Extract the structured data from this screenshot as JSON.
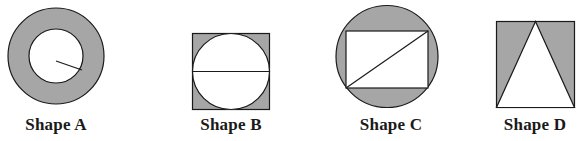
{
  "colors": {
    "shade": "#a6a6a6",
    "stroke": "#1a1a1a",
    "background": "#ffffff",
    "unshaded": "#ffffff"
  },
  "shapes": [
    {
      "id": "A",
      "label": "Shape A",
      "description": "Annulus: shaded ring between an outer circle and a concentric inner circle; a radius segment drawn inside the inner circle"
    },
    {
      "id": "B",
      "label": "Shape B",
      "description": "Square with an inscribed circle; the circle is unshaded with a horizontal diameter; the four corner regions are shaded"
    },
    {
      "id": "C",
      "label": "Shape C",
      "description": "Circle with an inscribed rectangle; the rectangle is unshaded with a diagonal from bottom-left to top-right; the four circular segments outside the rectangle are shaded"
    },
    {
      "id": "D",
      "label": "Shape D",
      "description": "Rectangle with an inscribed isosceles triangle whose apex is at the top-center and base is the bottom side; the triangle is unshaded and the two side regions are shaded"
    }
  ]
}
